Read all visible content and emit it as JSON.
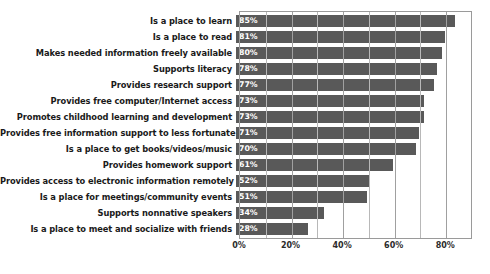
{
  "chart_data": {
    "type": "bar",
    "orientation": "horizontal",
    "title": "",
    "xlabel": "",
    "ylabel": "",
    "xlim": [
      0,
      90
    ],
    "xticks": [
      0,
      20,
      40,
      60,
      80
    ],
    "xtick_labels": [
      "0%",
      "20%",
      "40%",
      "60%",
      "80%"
    ],
    "grid": true,
    "grid_interval": 10,
    "legend": "none",
    "bar_color": "#595959",
    "value_label_color": "#ffffff",
    "categories": [
      "Is a place to learn",
      "Is a place to read",
      "Makes needed information freely available",
      "Supports literacy",
      "Provides research support",
      "Provides free computer/Internet access",
      "Promotes childhood learning and development",
      "Provides free information support to less fortunate",
      "Is a place to get books/videos/music",
      "Provides homework support",
      "Provides access to electronic information remotely",
      "Is a place for meetings/community events",
      "Supports nonnative speakers",
      "Is a place to meet and socialize with friends"
    ],
    "values": [
      85,
      81,
      80,
      78,
      77,
      73,
      73,
      71,
      70,
      61,
      52,
      51,
      34,
      28
    ],
    "value_labels": [
      "85%",
      "81%",
      "80%",
      "78%",
      "77%",
      "73%",
      "73%",
      "71%",
      "70%",
      "61%",
      "52%",
      "51%",
      "34%",
      "28%"
    ]
  }
}
